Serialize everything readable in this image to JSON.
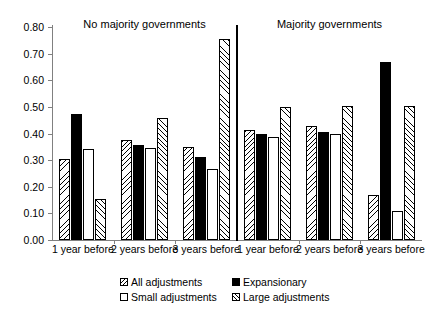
{
  "chart_data": {
    "type": "bar",
    "title": "",
    "xlabel": "",
    "ylabel": "",
    "ylim": [
      0.0,
      0.8
    ],
    "ytick_labels": [
      "0.00",
      "0.10",
      "0.20",
      "0.30",
      "0.40",
      "0.50",
      "0.60",
      "0.70",
      "0.80"
    ],
    "ytick_values": [
      0.0,
      0.1,
      0.2,
      0.3,
      0.4,
      0.5,
      0.6,
      0.7,
      0.8
    ],
    "grid": false,
    "legend_position": "bottom",
    "panels": [
      {
        "title": "No majority governments",
        "categories": [
          "1 year before",
          "2 years before",
          "3 years before"
        ],
        "series": [
          {
            "name": "All adjustments",
            "values": [
              0.305,
              0.375,
              0.35
            ]
          },
          {
            "name": "Expansionary",
            "values": [
              0.475,
              0.355,
              0.31
            ]
          },
          {
            "name": "Small adjustments",
            "values": [
              0.34,
              0.345,
              0.265
            ]
          },
          {
            "name": "Large adjustments",
            "values": [
              0.155,
              0.46,
              0.755
            ]
          }
        ]
      },
      {
        "title": "Majority governments",
        "categories": [
          "1 year before",
          "2 years before",
          "3 years before"
        ],
        "series": [
          {
            "name": "All adjustments",
            "values": [
              0.415,
              0.43,
              0.17
            ]
          },
          {
            "name": "Expansionary",
            "values": [
              0.4,
              0.405,
              0.67
            ]
          },
          {
            "name": "Small adjustments",
            "values": [
              0.385,
              0.4,
              0.11
            ]
          },
          {
            "name": "Large adjustments",
            "values": [
              0.5,
              0.505,
              0.505
            ]
          }
        ]
      }
    ],
    "legend": [
      {
        "label": "All adjustments",
        "pattern": "back-hatch"
      },
      {
        "label": "Expansionary",
        "pattern": "solid"
      },
      {
        "label": "Small adjustments",
        "pattern": "empty"
      },
      {
        "label": "Large adjustments",
        "pattern": "fwd-hatch"
      }
    ],
    "colors": {
      "foreground": "#000000",
      "background": "#ffffff",
      "axis": "#808080"
    }
  }
}
